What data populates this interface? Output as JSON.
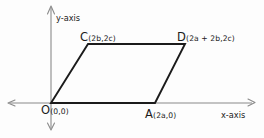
{
  "figure": {
    "background_color": "#fdfdfd",
    "axis_color": "#8a8a8a",
    "shape_color": "#1b1b1b",
    "axes": {
      "x_axis_label": "x-axis",
      "y_axis_label": "y-axis",
      "origin_x": 51,
      "origin_y": 103,
      "x_axis_left_end": 8,
      "x_axis_right_end": 255,
      "y_axis_top_end": 6,
      "y_axis_bottom_end": 130
    },
    "vertices": [
      {
        "id": "O",
        "letter": "O",
        "coords": "(0,0)",
        "px": 51,
        "py": 103
      },
      {
        "id": "A",
        "letter": "A",
        "coords": "(2a,0)",
        "px": 155,
        "py": 103
      },
      {
        "id": "C",
        "letter": "C",
        "coords": "(2b,2c)",
        "px": 88,
        "py": 44
      },
      {
        "id": "D",
        "letter": "D",
        "coords": "(2a + 2b,2c)",
        "px": 185,
        "py": 44
      }
    ],
    "edges": [
      {
        "from": "O",
        "to": "A"
      },
      {
        "from": "A",
        "to": "D"
      },
      {
        "from": "D",
        "to": "C"
      },
      {
        "from": "C",
        "to": "O"
      }
    ]
  }
}
